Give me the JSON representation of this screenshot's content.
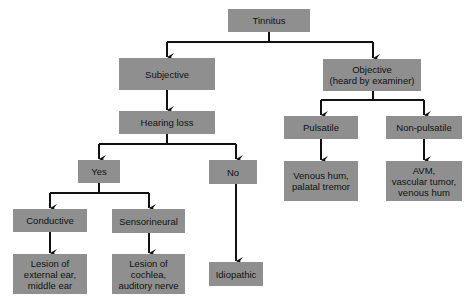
{
  "diagram": {
    "type": "flowchart",
    "node_color": "#8f8f8f",
    "edge_color": "#111111",
    "nodes": {
      "tinnitus": {
        "label": "Tinnitus"
      },
      "subjective": {
        "label": "Subjective"
      },
      "objective": {
        "label": "Objective\n(heard by examiner)"
      },
      "hearing_loss": {
        "label": "Hearing loss"
      },
      "pulsatile": {
        "label": "Pulsatile"
      },
      "non_pulsatile": {
        "label": "Non-pulsatile"
      },
      "yes": {
        "label": "Yes"
      },
      "no": {
        "label": "No"
      },
      "pulsatile_causes": {
        "label": "Venous hum,\npalatal tremor"
      },
      "non_pulsatile_causes": {
        "label": "AVM,\nvascular tumor,\nvenous hum"
      },
      "conductive": {
        "label": "Conductive"
      },
      "sensorineural": {
        "label": "Sensorineural"
      },
      "conductive_lesion": {
        "label": "Lesion of\nexternal ear,\nmiddle ear"
      },
      "sensorineural_lesion": {
        "label": "Lesion of\ncochlea,\nauditory nerve"
      },
      "idiopathic": {
        "label": "Idiopathic"
      }
    },
    "edges": [
      [
        "tinnitus",
        "subjective"
      ],
      [
        "tinnitus",
        "objective"
      ],
      [
        "subjective",
        "hearing_loss"
      ],
      [
        "hearing_loss",
        "yes"
      ],
      [
        "hearing_loss",
        "no"
      ],
      [
        "yes",
        "conductive"
      ],
      [
        "yes",
        "sensorineural"
      ],
      [
        "conductive",
        "conductive_lesion"
      ],
      [
        "sensorineural",
        "sensorineural_lesion"
      ],
      [
        "no",
        "idiopathic"
      ],
      [
        "objective",
        "pulsatile"
      ],
      [
        "objective",
        "non_pulsatile"
      ],
      [
        "pulsatile",
        "pulsatile_causes"
      ],
      [
        "non_pulsatile",
        "non_pulsatile_causes"
      ]
    ]
  }
}
